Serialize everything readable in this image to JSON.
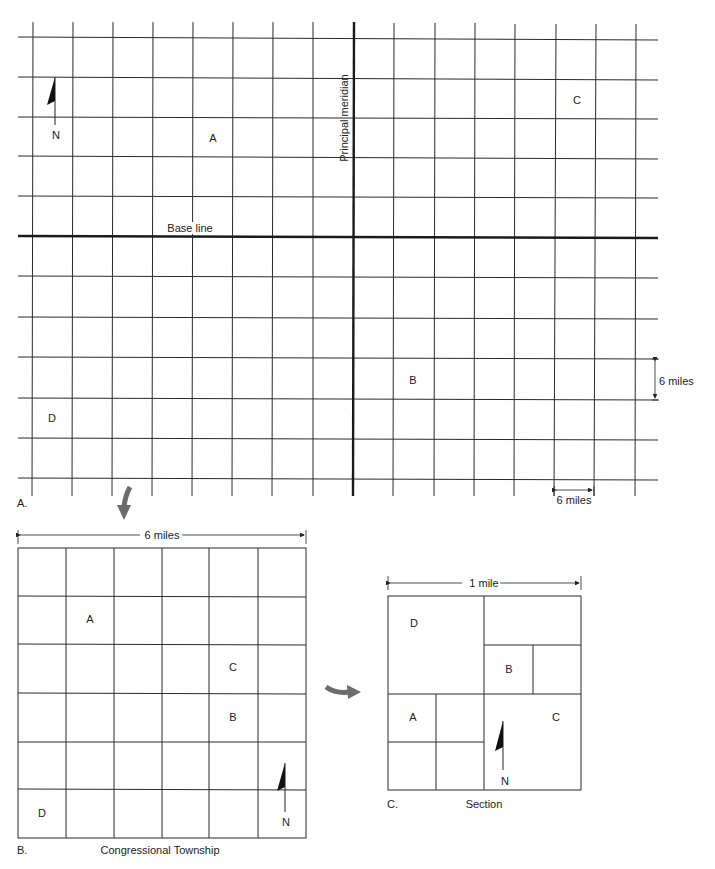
{
  "panel_a": {
    "caption": "A.",
    "base_line_label": "Base line",
    "meridian_label": "Principal  meridian",
    "north_label": "N",
    "regions": [
      "A",
      "B",
      "C",
      "D"
    ],
    "scale_vertical": "6 miles",
    "scale_horizontal": "6 miles"
  },
  "panel_b": {
    "caption": "B.",
    "title": "Congressional Township",
    "scale": "6 miles",
    "north_label": "N",
    "regions": [
      "A",
      "C",
      "B",
      "D"
    ]
  },
  "panel_c": {
    "caption": "C.",
    "title": "Section",
    "scale": "1 mile",
    "north_label": "N",
    "regions": [
      "D",
      "B",
      "A",
      "C"
    ]
  },
  "colors": {
    "line": "#2a2a2a",
    "heavy_line": "#1a1a1a",
    "arrow": "#6b6b6b"
  }
}
